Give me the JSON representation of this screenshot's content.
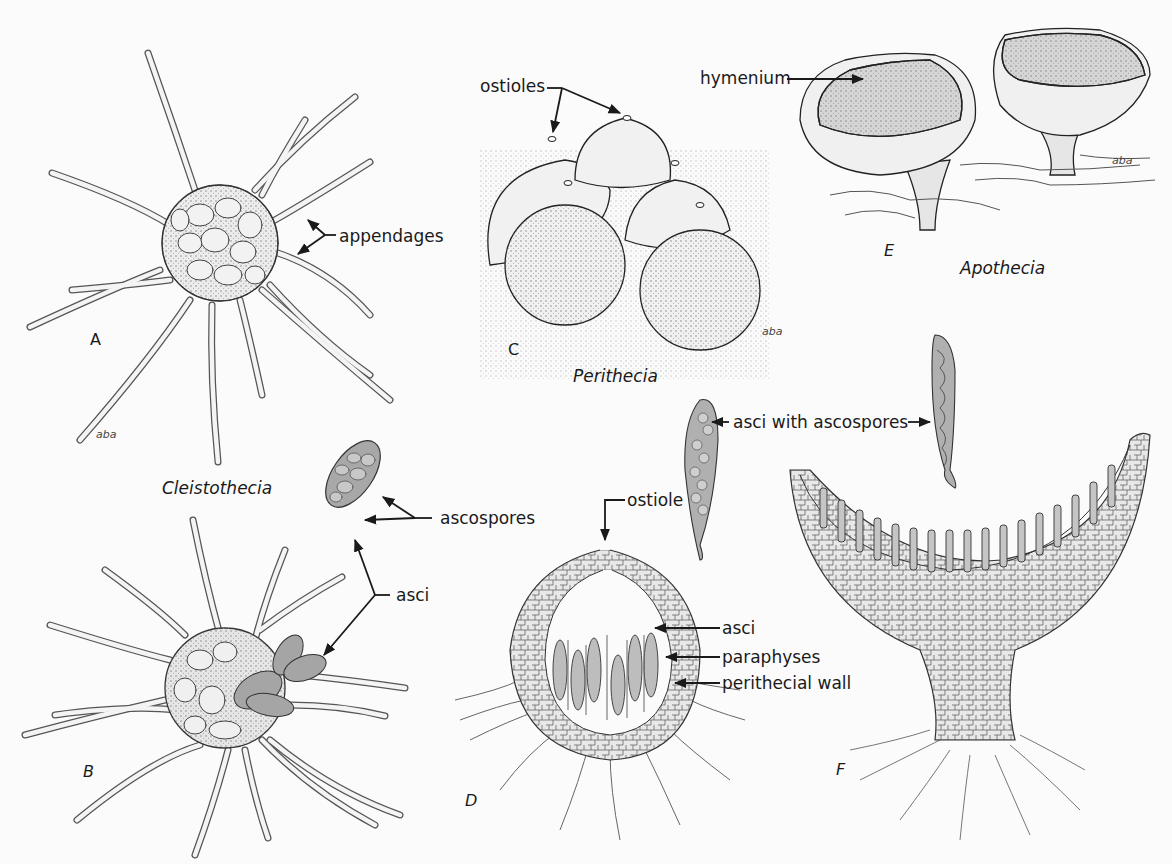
{
  "figure": {
    "panels": [
      {
        "letter": "A",
        "group": "Cleistothecia",
        "description": "intact cleistothecium with radiating appendages"
      },
      {
        "letter": "B",
        "group": "Cleistothecia",
        "description": "ruptured cleistothecium releasing asci"
      },
      {
        "letter": "C",
        "group": "Perithecia",
        "description": "cluster of flask-shaped perithecia with ostioles"
      },
      {
        "letter": "D",
        "group": "Perithecia",
        "description": "section through perithecium"
      },
      {
        "letter": "E",
        "group": "Apothecia",
        "description": "cup-shaped apothecia"
      },
      {
        "letter": "F",
        "group": "Apothecia",
        "description": "section through apothecium"
      }
    ]
  },
  "captions": {
    "cleistothecia": "Cleistothecia",
    "perithecia": "Perithecia",
    "apothecia": "Apothecia"
  },
  "letters": {
    "a": "A",
    "b": "B",
    "c": "C",
    "d": "D",
    "e": "E",
    "f": "F"
  },
  "labels": {
    "appendages": "appendages",
    "ascospores": "ascospores",
    "asci_b": "asci",
    "ostioles": "ostioles",
    "hymenium": "hymenium",
    "ostiole": "ostiole",
    "asci_d": "asci",
    "paraphyses": "paraphyses",
    "perithecial_wall": "perithecial wall",
    "asci_with_ascospores": "asci with ascospores"
  },
  "signatures": {
    "artist": "aba"
  },
  "colors": {
    "ink": "#1a1a1a",
    "paper": "#fbfbfb",
    "stipple": "#cfcfcf",
    "ascus_fill": "#a8a8a8"
  }
}
